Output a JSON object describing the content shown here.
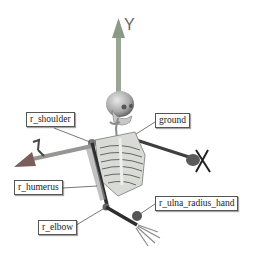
{
  "figure": {
    "axes": [
      {
        "name": "Y",
        "label": "Y",
        "color": "#8a9a86"
      },
      {
        "name": "Z",
        "label": "Z",
        "color": "#8a6a66"
      },
      {
        "name": "X",
        "label": "X",
        "color": "#4a4a4a"
      }
    ],
    "labels": [
      {
        "id": "r_shoulder",
        "text": "r_shoulder"
      },
      {
        "id": "ground",
        "text": "ground"
      },
      {
        "id": "r_humerus",
        "text": "r_humerus"
      },
      {
        "id": "r_ulna_radius_hand",
        "text": "r_ulna_radius_hand"
      },
      {
        "id": "r_elbow",
        "text": "r_elbow"
      }
    ]
  }
}
